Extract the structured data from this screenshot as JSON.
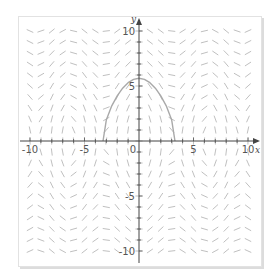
{
  "chart_data": {
    "type": "slope_field",
    "title": "",
    "xlabel": "x",
    "ylabel": "y",
    "xlim": [
      -11,
      11
    ],
    "ylim": [
      -11,
      11
    ],
    "grid": false,
    "legend": null,
    "x_ticks": [
      -10,
      -5,
      0,
      5,
      10
    ],
    "y_ticks": [
      -10,
      -5,
      5,
      10
    ],
    "x_tick_labels": [
      "-10",
      "-5",
      "0",
      "5",
      "10"
    ],
    "y_tick_labels": [
      "-10",
      "-5",
      "5",
      "10"
    ],
    "minor_tick_step": 1,
    "field": {
      "description": "direction field with wavy bands, period approx 2*pi in x; near-vertical slopes close to y=0",
      "model": "dy/dx = -a*sin(x)/y",
      "a": 8.2,
      "grid_step": 1,
      "segment_color": "#b8b8b8"
    },
    "series": [
      {
        "name": "solution curve",
        "color": "#a9a9a9",
        "x": [
          -3.3,
          -3.0,
          -2.5,
          -2.0,
          -1.5,
          -1.0,
          -0.5,
          0,
          0.5,
          1.0,
          1.5,
          2.0,
          2.5,
          3.0,
          3.3
        ],
        "y": [
          0,
          1.9,
          3.2,
          4.1,
          4.8,
          5.3,
          5.6,
          5.7,
          5.6,
          5.3,
          4.8,
          4.1,
          3.2,
          1.9,
          0
        ]
      }
    ]
  },
  "axes": {
    "x_name": "x",
    "y_name": "y",
    "axis_color": "#444444",
    "label_color": "#555555"
  },
  "frame": {
    "border_color": "#e2e2e2",
    "background": "#ffffff"
  }
}
